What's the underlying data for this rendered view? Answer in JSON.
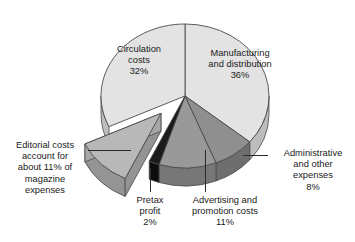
{
  "chart_data": {
    "type": "pie",
    "title": "",
    "units": "percent",
    "legend_position": "none",
    "grid": false,
    "total": 100,
    "categories": [
      "Manufacturing and distribution",
      "Administrative and other expenses",
      "Advertising and promotion costs",
      "Pretax profit",
      "Editorial costs",
      "Circulation costs"
    ],
    "values": [
      36,
      8,
      11,
      2,
      11,
      32
    ],
    "slices": [
      {
        "name": "manufacturing",
        "label_line1": "Manufacturing",
        "label_line2": "and distribution",
        "value": 36,
        "value_text": "36%",
        "color": "#e3e3e3",
        "side_color": "#bdbdbd",
        "exploded": false,
        "label_placement": "inside"
      },
      {
        "name": "administrative",
        "label_line1": "Administrative",
        "label_line2": "and other",
        "label_line3": "expenses",
        "value": 8,
        "value_text": "8%",
        "color": "#8f8f8f",
        "side_color": "#6e6e6e",
        "exploded": false,
        "label_placement": "callout-right"
      },
      {
        "name": "advertising",
        "label_line1": "Advertising and",
        "label_line2": "promotion costs",
        "value": 11,
        "value_text": "11%",
        "color": "#999999",
        "side_color": "#777777",
        "exploded": false,
        "label_placement": "callout-bottom"
      },
      {
        "name": "pretax-profit",
        "label_line1": "Pretax",
        "label_line2": "profit",
        "value": 2,
        "value_text": "2%",
        "color": "#1a1a1a",
        "side_color": "#0d0d0d",
        "exploded": false,
        "label_placement": "callout-bottom"
      },
      {
        "name": "editorial",
        "label_line1": "Editorial costs",
        "label_line2": "account for",
        "label_line3": "about 11% of",
        "label_line4": "magazine",
        "label_line5": "expenses",
        "value": 11,
        "value_text": "11%",
        "color": "#b8b8b8",
        "side_color": "#949494",
        "exploded": true,
        "label_placement": "callout-left"
      },
      {
        "name": "circulation",
        "label_line1": "Circulation",
        "label_line2": "costs",
        "value": 32,
        "value_text": "32%",
        "color": "#e3e3e3",
        "side_color": "#bdbdbd",
        "exploded": false,
        "label_placement": "inside"
      }
    ]
  },
  "labels": {
    "circulation": {
      "line1": "Circulation",
      "line2": "costs",
      "pct": "32%"
    },
    "manufacturing": {
      "line1": "Manufacturing",
      "line2": "and distribution",
      "pct": "36%"
    },
    "editorial": {
      "line1": "Editorial costs",
      "line2": "account for",
      "line3": "about 11% of",
      "line4": "magazine",
      "line5": "expenses"
    },
    "administrative": {
      "line1": "Administrative",
      "line2": "and other",
      "line3": "expenses",
      "pct": "8%"
    },
    "pretax": {
      "line1": "Pretax",
      "line2": "profit",
      "pct": "2%"
    },
    "advertising": {
      "line1": "Advertising and",
      "line2": "promotion costs",
      "pct": "11%"
    }
  },
  "colors": {
    "background": "#ffffff",
    "outline": "#4a4a4a",
    "text": "#1a1a1a",
    "leader": "#2b2b2b"
  },
  "geometry": {
    "cx": 185,
    "cy": 96,
    "rx": 84,
    "ry": 72,
    "depth": 18
  }
}
